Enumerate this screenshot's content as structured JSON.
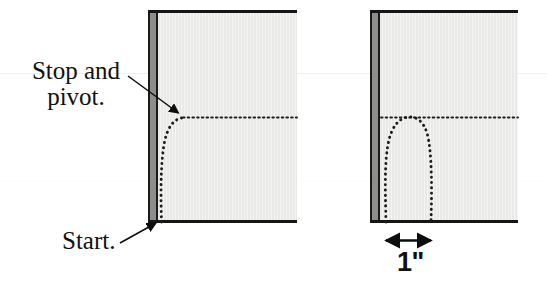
{
  "figure": {
    "type": "instructional-diagram",
    "background_color": "#ffffff"
  },
  "labels": {
    "stop_and_pivot_line1": "Stop and",
    "stop_and_pivot_line2": "pivot.",
    "start": "Start.",
    "measurement": "1\""
  },
  "panels": [
    {
      "name": "left-fabric-panel",
      "fill_color": "#e9e9e7",
      "edge_color": "#151515",
      "selvedge_color": "#8d8d8b",
      "stitch_line_style": "dotted",
      "stitch_color": "#1c1c1c",
      "description": "Fabric piece with a dotted stitching line that starts at the bottom edge near the selvedge, runs up, curves right and continues as a horizontal dotted line."
    },
    {
      "name": "right-fabric-panel",
      "fill_color": "#e9e9e7",
      "edge_color": "#151515",
      "selvedge_color": "#8d8d8b",
      "stitch_line_style": "dotted",
      "stitch_color": "#1c1c1c",
      "description": "Fabric piece with a dotted arch-shaped stitching line rising from the bottom edge, peaking at the horizontal dotted guide line, and returning to the bottom edge one inch away."
    }
  ],
  "annotations": [
    {
      "name": "stop-and-pivot-callout",
      "text_lines": [
        "Stop and",
        "pivot."
      ],
      "arrow": "points right and down to the top of the curve on the left panel"
    },
    {
      "name": "start-callout",
      "text_lines": [
        "Start."
      ],
      "arrow": "points up and right to the bottom edge of the left panel"
    },
    {
      "name": "one-inch-dimension",
      "text_lines": [
        "1\""
      ],
      "arrow": "double-headed horizontal arrow measuring the width of the arch on the right panel"
    }
  ],
  "artifact_lines": {
    "top_band_color": "#efefef",
    "mid_band_color": "#fcfcfc"
  }
}
